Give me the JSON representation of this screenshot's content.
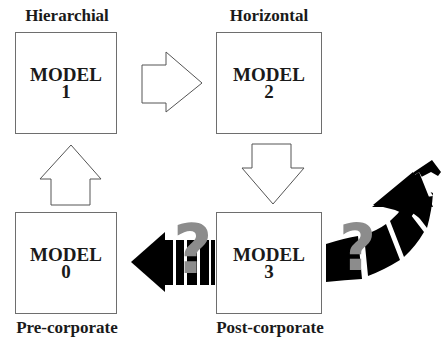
{
  "diagram": {
    "models": [
      {
        "id": "model-1",
        "title": "MODEL",
        "number": "1",
        "label": "Hierarchial"
      },
      {
        "id": "model-2",
        "title": "MODEL",
        "number": "2",
        "label": "Horizontal"
      },
      {
        "id": "model-3",
        "title": "MODEL",
        "number": "3",
        "label": "Post-corporate"
      },
      {
        "id": "model-0",
        "title": "MODEL",
        "number": "0",
        "label": "Pre-corporate"
      }
    ],
    "arrows": [
      {
        "from": "model-1",
        "to": "model-2",
        "style": "outline"
      },
      {
        "from": "model-2",
        "to": "model-3",
        "style": "outline"
      },
      {
        "from": "model-0",
        "to": "model-1",
        "style": "outline"
      },
      {
        "from": "model-3",
        "to": "model-0",
        "style": "solid-broken",
        "annotation": "?"
      },
      {
        "from": "model-3",
        "to": "future",
        "style": "solid-curved-broken",
        "annotation": "?"
      }
    ],
    "question_mark": "?",
    "colors": {
      "box_border": "#6e6e6e",
      "solid_arrow": "#000000",
      "question_mark": "#8c8c8c"
    }
  }
}
